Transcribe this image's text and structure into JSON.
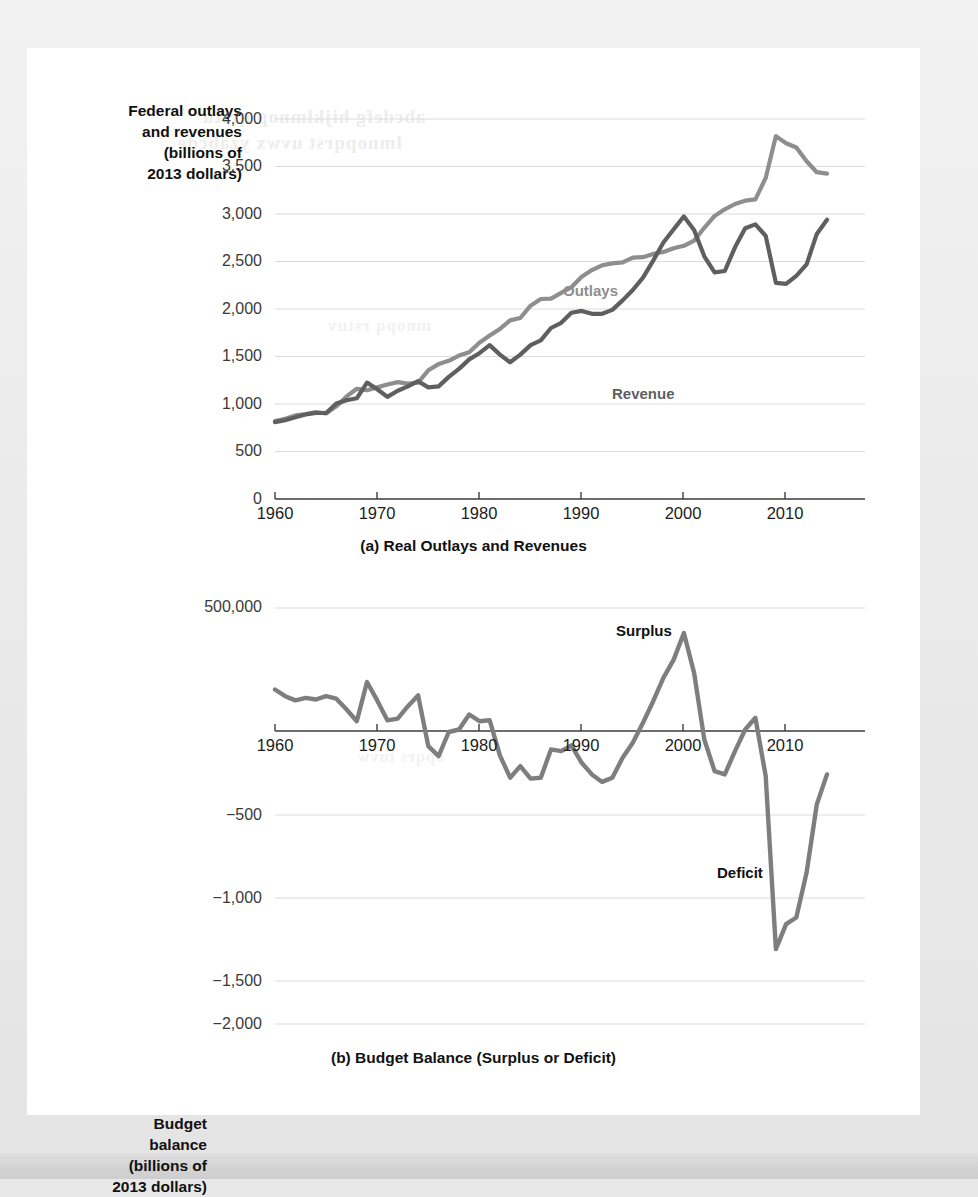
{
  "figure": {
    "panels": [
      {
        "id": "a",
        "caption": "(a) Real Outlays and Revenues",
        "axis_title": "Federal outlays\nand revenues\n(billions of\n2013 dollars)",
        "yticks": [
          "4,000",
          "3,500",
          "3,000",
          "2,500",
          "2,000",
          "1,500",
          "1,000",
          "500",
          "0"
        ],
        "xticks": [
          "1960",
          "1970",
          "1980",
          "1990",
          "2000",
          "2010"
        ],
        "series_labels": {
          "outlays": "Outlays",
          "revenue": "Revenue"
        }
      },
      {
        "id": "b",
        "caption": "(b) Budget Balance (Surplus or Deficit)",
        "axis_title": "Budget\nbalance\n(billions of\n2013 dollars)",
        "yticks": [
          "500,000",
          "−500",
          "−1,000",
          "−1,500",
          "−2,000"
        ],
        "xticks": [
          "1960",
          "1970",
          "1980",
          "1990",
          "2000",
          "2010"
        ],
        "series_labels": {
          "surplus": "Surplus",
          "deficit": "Deficit"
        }
      }
    ]
  },
  "colors": {
    "outlays_line": "#8e8e8e",
    "revenue_line": "#5f5f5f",
    "balance_line": "#7e7e7e",
    "gridline": "#dcdcdc",
    "axis": "#3c3c3c",
    "page_background": "#e8e8e8",
    "card_background": "#ffffff"
  },
  "ghost_text": {
    "line1": "bleed-through",
    "line2": "bleed-through",
    "line3": "bleed-through",
    "line4": "bleed-through"
  },
  "chart_data": [
    {
      "type": "line",
      "id": "a",
      "title": "(a) Real Outlays and Revenues",
      "xlabel": "",
      "ylabel": "Federal outlays and revenues (billions of 2013 dollars)",
      "xlim": [
        1960,
        2014
      ],
      "ylim": [
        0,
        4000
      ],
      "ytick_values": [
        0,
        500,
        1000,
        1500,
        2000,
        2500,
        3000,
        3500,
        4000
      ],
      "xtick_values": [
        1960,
        1970,
        1980,
        1990,
        2000,
        2010
      ],
      "grid": true,
      "legend": "inline-annotations",
      "x": [
        1960,
        1961,
        1962,
        1963,
        1964,
        1965,
        1966,
        1967,
        1968,
        1969,
        1970,
        1971,
        1972,
        1973,
        1974,
        1975,
        1976,
        1977,
        1978,
        1979,
        1980,
        1981,
        1982,
        1983,
        1984,
        1985,
        1986,
        1987,
        1988,
        1989,
        1990,
        1991,
        1992,
        1993,
        1994,
        1995,
        1996,
        1997,
        1998,
        1999,
        2000,
        2001,
        2002,
        2003,
        2004,
        2005,
        2006,
        2007,
        2008,
        2009,
        2010,
        2011,
        2012,
        2013,
        2014
      ],
      "series": [
        {
          "name": "Outlays",
          "color": "#8e8e8e",
          "values": [
            820,
            845,
            880,
            895,
            915,
            900,
            975,
            1080,
            1160,
            1145,
            1175,
            1205,
            1230,
            1215,
            1225,
            1355,
            1420,
            1455,
            1510,
            1545,
            1645,
            1720,
            1790,
            1880,
            1905,
            2035,
            2105,
            2110,
            2170,
            2230,
            2340,
            2410,
            2460,
            2480,
            2490,
            2540,
            2545,
            2580,
            2600,
            2640,
            2665,
            2720,
            2855,
            2980,
            3050,
            3105,
            3140,
            3155,
            3380,
            3820,
            3745,
            3700,
            3555,
            3440,
            3425
          ]
        },
        {
          "name": "Revenue",
          "color": "#5f5f5f",
          "values": [
            810,
            830,
            860,
            890,
            905,
            905,
            1005,
            1040,
            1060,
            1225,
            1155,
            1075,
            1140,
            1185,
            1240,
            1175,
            1185,
            1285,
            1370,
            1470,
            1535,
            1620,
            1520,
            1440,
            1520,
            1620,
            1670,
            1800,
            1855,
            1960,
            1980,
            1950,
            1950,
            1990,
            2090,
            2200,
            2330,
            2510,
            2700,
            2840,
            2975,
            2830,
            2555,
            2385,
            2400,
            2650,
            2850,
            2890,
            2770,
            2275,
            2265,
            2350,
            2470,
            2790,
            2940
          ]
        }
      ]
    },
    {
      "type": "line",
      "id": "b",
      "title": "(b) Budget Balance (Surplus or Deficit)",
      "xlabel": "",
      "ylabel": "Budget balance (billions of 2013 dollars)",
      "xlim": [
        1960,
        2014
      ],
      "ylim": [
        -2000,
        500
      ],
      "ytick_values": [
        500,
        -500,
        -1000,
        -1500,
        -2000
      ],
      "ytick_labels": [
        "500,000",
        "−500",
        "−1,000",
        "−1,500",
        "−2,000"
      ],
      "xtick_values": [
        1960,
        1970,
        1980,
        1990,
        2000,
        2010
      ],
      "grid": true,
      "zero_line": true,
      "annotations": [
        {
          "text": "Surplus",
          "x": 1993,
          "y": 300
        },
        {
          "text": "Deficit",
          "x": 2004,
          "y": -880
        }
      ],
      "x": [
        1960,
        1961,
        1962,
        1963,
        1964,
        1965,
        1966,
        1967,
        1968,
        1969,
        1970,
        1971,
        1972,
        1973,
        1974,
        1975,
        1976,
        1977,
        1978,
        1979,
        1980,
        1981,
        1982,
        1983,
        1984,
        1985,
        1986,
        1987,
        1988,
        1989,
        1990,
        1991,
        1992,
        1993,
        1994,
        1995,
        1996,
        1997,
        1998,
        1999,
        2000,
        2001,
        2002,
        2003,
        2004,
        2005,
        2006,
        2007,
        2008,
        2009,
        2010,
        2011,
        2012,
        2013,
        2014
      ],
      "series": [
        {
          "name": "Budget balance",
          "color": "#7e7e7e",
          "values": [
            10,
            -30,
            -55,
            -40,
            -50,
            -30,
            -45,
            -110,
            -180,
            55,
            -55,
            -175,
            -165,
            -90,
            -25,
            -330,
            -390,
            -245,
            -230,
            -140,
            -180,
            -175,
            -385,
            -520,
            -450,
            -525,
            -520,
            -350,
            -360,
            -325,
            -430,
            -500,
            -545,
            -520,
            -400,
            -310,
            -190,
            -60,
            80,
            190,
            350,
            110,
            -290,
            -480,
            -500,
            -360,
            -230,
            -160,
            -510,
            -1550,
            -1400,
            -1360,
            -1090,
            -680,
            -500
          ]
        }
      ]
    }
  ]
}
